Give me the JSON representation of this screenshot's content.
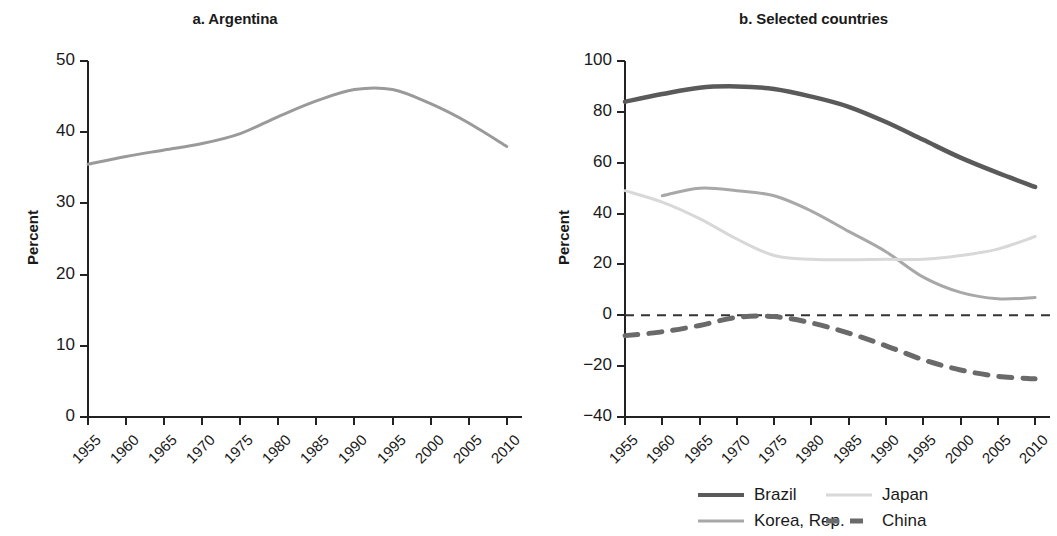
{
  "figure": {
    "panel_a_title": "a. Argentina",
    "panel_b_title": "b. Selected countries",
    "ylabel": "Percent"
  },
  "legend": {
    "items": [
      {
        "label": "Brazil",
        "color": "#5a5a5a",
        "style": "solid",
        "width": 4
      },
      {
        "label": "Japan",
        "color": "#d8d8d8",
        "style": "solid",
        "width": 3
      },
      {
        "label": "Korea, Rep.",
        "color": "#a8a8a8",
        "style": "solid",
        "width": 3
      },
      {
        "label": "China",
        "color": "#6a6a6a",
        "style": "dashed",
        "width": 5
      }
    ]
  },
  "chart_data": [
    {
      "type": "line",
      "title": "a. Argentina",
      "xlabel": "",
      "ylabel": "Percent",
      "xlim": [
        1955,
        2012
      ],
      "ylim": [
        0,
        50
      ],
      "yticks": [
        0,
        10,
        20,
        30,
        40,
        50
      ],
      "xticks": [
        1955,
        1960,
        1965,
        1970,
        1975,
        1980,
        1985,
        1990,
        1995,
        2000,
        2005,
        2010
      ],
      "grid": false,
      "legend_position": "none",
      "series": [
        {
          "name": "Argentina",
          "color": "#9a9a9a",
          "style": "solid",
          "x": [
            1955,
            1960,
            1965,
            1970,
            1975,
            1980,
            1985,
            1990,
            1995,
            2000,
            2005,
            2010
          ],
          "values": [
            35.5,
            36.6,
            37.5,
            38.4,
            39.8,
            42.2,
            44.4,
            46.0,
            46.0,
            44.0,
            41.3,
            38.0
          ]
        }
      ]
    },
    {
      "type": "line",
      "title": "b. Selected countries",
      "xlabel": "",
      "ylabel": "Percent",
      "xlim": [
        1955,
        2012
      ],
      "ylim": [
        -40,
        100
      ],
      "yticks": [
        -40,
        -20,
        0,
        20,
        40,
        60,
        80,
        100
      ],
      "xticks": [
        1955,
        1960,
        1965,
        1970,
        1975,
        1980,
        1985,
        1990,
        1995,
        2000,
        2005,
        2010
      ],
      "grid": false,
      "zero_reference_line": 0,
      "legend_position": "bottom",
      "series": [
        {
          "name": "Brazil",
          "color": "#5a5a5a",
          "style": "solid",
          "x": [
            1955,
            1960,
            1965,
            1970,
            1975,
            1980,
            1985,
            1990,
            1995,
            2000,
            2005,
            2010
          ],
          "values": [
            84,
            87,
            89.5,
            90,
            89,
            86,
            82,
            76,
            69,
            62,
            56,
            50.5
          ]
        },
        {
          "name": "Korea, Rep.",
          "color": "#a8a8a8",
          "style": "solid",
          "x": [
            1960,
            1965,
            1970,
            1975,
            1980,
            1985,
            1990,
            1995,
            2000,
            2005,
            2010
          ],
          "values": [
            47,
            50,
            49,
            47,
            41,
            33,
            25,
            15,
            9,
            6.5,
            7
          ]
        },
        {
          "name": "Japan",
          "color": "#d8d8d8",
          "style": "solid",
          "x": [
            1955,
            1960,
            1965,
            1970,
            1975,
            1980,
            1985,
            1990,
            1995,
            2000,
            2005,
            2010
          ],
          "values": [
            49,
            44.5,
            38,
            30,
            23.5,
            22,
            21.8,
            22,
            22,
            23.5,
            26,
            31
          ]
        },
        {
          "name": "China",
          "color": "#6a6a6a",
          "style": "dashed",
          "x": [
            1955,
            1960,
            1965,
            1970,
            1975,
            1980,
            1985,
            1990,
            1995,
            2000,
            2005,
            2010
          ],
          "values": [
            -8,
            -6.5,
            -4,
            -0.8,
            -0.5,
            -3,
            -7,
            -12,
            -17.5,
            -21.5,
            -24,
            -25
          ]
        }
      ]
    }
  ]
}
